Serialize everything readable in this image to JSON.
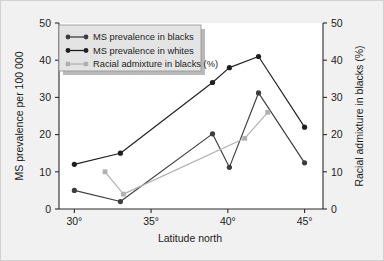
{
  "chart_data": {
    "type": "line",
    "title": "",
    "xlabel": "Latitude north",
    "ylabel": "MS prevalence per 100 000",
    "y2label": "Racial admixture in blacks (%)",
    "xlim": [
      29,
      46.2
    ],
    "ylim": [
      0,
      50
    ],
    "y2lim": [
      0,
      50
    ],
    "grid": false,
    "legend_position": "upper-left-inside",
    "xticks": [
      30,
      35,
      40,
      45
    ],
    "xticklabels": [
      "30°",
      "35°",
      "40°",
      "45°"
    ],
    "yticks": [
      0,
      10,
      20,
      30,
      40,
      50
    ],
    "yticklabels": [
      "0",
      "10",
      "20",
      "30",
      "40",
      "50"
    ],
    "y2ticks": [
      0,
      10,
      20,
      30,
      40,
      50
    ],
    "y2ticklabels": [
      "0",
      "10",
      "20",
      "30",
      "40",
      "50"
    ],
    "series": [
      {
        "name": "MS prevalence in blacks",
        "axis": "left",
        "color": "#3d3d3d",
        "marker": "circle",
        "points": [
          {
            "x": 30.0,
            "y": 5.0
          },
          {
            "x": 33.0,
            "y": 2.0
          },
          {
            "x": 39.0,
            "y": 20.2
          },
          {
            "x": 40.1,
            "y": 11.2
          },
          {
            "x": 42.0,
            "y": 31.2
          },
          {
            "x": 45.0,
            "y": 12.4
          }
        ]
      },
      {
        "name": "MS prevalence in whites",
        "axis": "left",
        "color": "#1f1f1f",
        "marker": "circle",
        "points": [
          {
            "x": 30.0,
            "y": 12.0
          },
          {
            "x": 33.0,
            "y": 15.0
          },
          {
            "x": 39.0,
            "y": 34.0
          },
          {
            "x": 40.1,
            "y": 38.0
          },
          {
            "x": 42.0,
            "y": 41.0
          },
          {
            "x": 45.0,
            "y": 22.0
          }
        ]
      },
      {
        "name": "Racial admixture in blacks (%)",
        "axis": "right",
        "color": "#b0b0b0",
        "marker": "square",
        "points": [
          {
            "x": 32.0,
            "y": 10.0
          },
          {
            "x": 33.2,
            "y": 4.0
          },
          {
            "x": 41.1,
            "y": 19.0
          },
          {
            "x": 42.6,
            "y": 26.0
          }
        ]
      }
    ]
  },
  "legend": {
    "items": [
      {
        "label": "MS prevalence in blacks",
        "color": "#3d3d3d",
        "marker": "circle"
      },
      {
        "label": "MS prevalence in whites",
        "color": "#1f1f1f",
        "marker": "circle"
      },
      {
        "label": "Racial admixture in blacks (%)",
        "color": "#b0b0b0",
        "marker": "square"
      }
    ]
  },
  "colors": {
    "page_background": "#f1f1f1",
    "plot_background": "#ffffff",
    "axis": "#2b2b2b",
    "legend_fill": "#e4e4e4",
    "legend_border": "#9a9a9a"
  }
}
